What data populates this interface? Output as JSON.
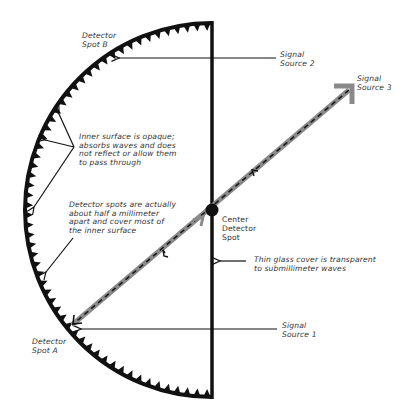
{
  "diagram": {
    "title": "",
    "colors": {
      "ink": "#111111",
      "beam": "#8a8a8a",
      "beam_dash": "#1a1a1a",
      "text": "#333333",
      "background": "#ffffff"
    },
    "labels": {
      "detector_spot_b": [
        "Detector",
        "Spot B"
      ],
      "signal_source_2": [
        "Signal",
        "Source 2"
      ],
      "signal_source_3": [
        "Signal",
        "Source 3"
      ],
      "inner_surface": [
        "Inner surface is opaque;",
        "absorbs waves and does",
        "not reflect or allow them",
        "to pass through"
      ],
      "detector_spots": [
        "Detector spots are actually",
        "about half a millimeter",
        "apart and cover most of",
        "the inner surface"
      ],
      "center_detector": [
        "Center",
        "Detector",
        "Spot"
      ],
      "glass_cover": [
        "Thin glass cover is transparent",
        "to submillimeter waves"
      ],
      "signal_source_1": [
        "Signal",
        "Source 1"
      ],
      "detector_spot_a": [
        "Detector",
        "Spot A"
      ]
    },
    "elements": {
      "hemisphere": "half-circle detector surface with sawtooth detector spots",
      "glass_cover": "vertical flat side",
      "center_spot": "filled circle at center",
      "beam": "Signal Source 3 beam passing through center to Detector Spot A"
    }
  }
}
